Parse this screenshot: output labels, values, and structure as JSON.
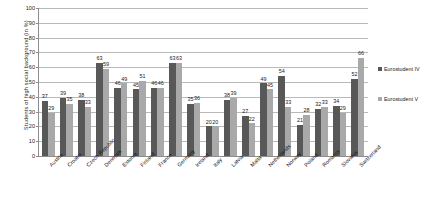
{
  "chart_data": {
    "type": "bar",
    "title": "",
    "xlabel": "",
    "ylabel": "Students  of  high  social  background  (in %)",
    "ylim": [
      0,
      100
    ],
    "ytick_step": 10,
    "yticks": [
      100,
      90,
      80,
      70,
      60,
      50,
      40,
      30,
      20,
      10,
      0
    ],
    "grid": true,
    "legend_position": "right",
    "categories": [
      "Austria",
      "Croatia",
      "Czech Republic",
      "Denmark",
      "Estonia",
      "Finland",
      "France",
      "Germany",
      "Ireland",
      "Italy",
      "Latvia",
      "Malta",
      "Netherlands",
      "Norway",
      "Poland",
      "Romania",
      "Slovakia",
      "Switzerland"
    ],
    "series": [
      {
        "name": "Eurostudent IV",
        "color": "#585858",
        "values": [
          37,
          39,
          38,
          63,
          46,
          45,
          46,
          63,
          35,
          20,
          38,
          27,
          49,
          54,
          21,
          32,
          34,
          52
        ]
      },
      {
        "name": "Eurostudent V",
        "color": "#a9a9a9",
        "values": [
          29,
          35,
          33,
          59,
          49,
          51,
          46,
          63,
          36,
          20,
          39,
          22,
          45,
          33,
          28,
          33,
          29,
          66
        ]
      }
    ]
  },
  "legend": {
    "items": [
      {
        "label": "Eurostudent IV"
      },
      {
        "label": "Eurostudent V"
      }
    ]
  }
}
